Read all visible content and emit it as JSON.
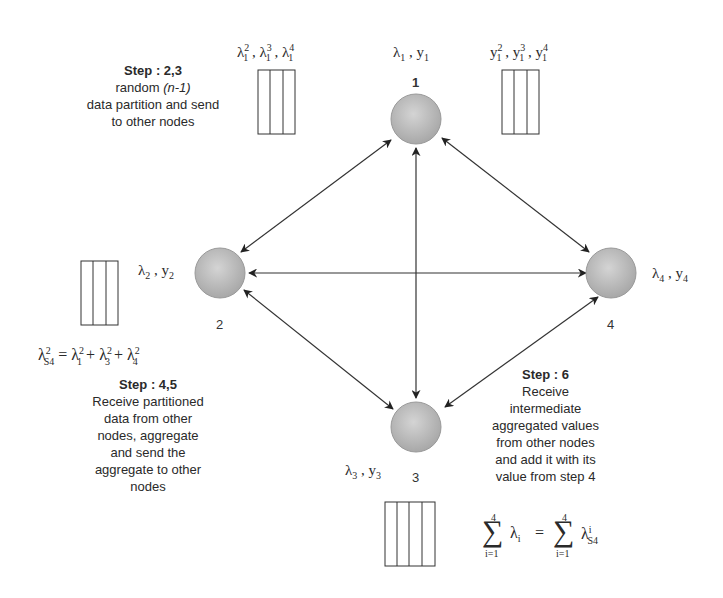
{
  "diagram": {
    "type": "distributed-aggregation-network",
    "nodes": [
      {
        "id": "1",
        "label": "1",
        "vars": "λ1 , y1",
        "x": 416,
        "y": 119
      },
      {
        "id": "2",
        "label": "2",
        "vars": "λ2 , y2",
        "x": 220,
        "y": 273
      },
      {
        "id": "3",
        "label": "3",
        "vars": "λ3 , y3",
        "x": 416,
        "y": 427
      },
      {
        "id": "4",
        "label": "4",
        "vars": "λ4 , y4",
        "x": 611,
        "y": 273
      }
    ],
    "edges": [
      {
        "from": "1",
        "to": "2",
        "bidirectional": true
      },
      {
        "from": "1",
        "to": "3",
        "bidirectional": true
      },
      {
        "from": "1",
        "to": "4",
        "bidirectional": true
      },
      {
        "from": "2",
        "to": "3",
        "bidirectional": true
      },
      {
        "from": "2",
        "to": "4",
        "bidirectional": true
      },
      {
        "from": "3",
        "to": "4",
        "bidirectional": true
      }
    ]
  },
  "node_labels": {
    "n1": "1",
    "n2": "2",
    "n3": "3",
    "n4": "4"
  },
  "partitions": {
    "lambda1_parts": {
      "base": "λ",
      "items": [
        {
          "sup": "2",
          "sub": "1"
        },
        {
          "sup": "3",
          "sub": "1"
        },
        {
          "sup": "4",
          "sub": "1"
        }
      ]
    },
    "y1_parts": {
      "base": "y",
      "items": [
        {
          "sup": "2",
          "sub": "1"
        },
        {
          "sup": "3",
          "sub": "1"
        },
        {
          "sup": "4",
          "sub": "1"
        }
      ]
    }
  },
  "steps": {
    "step23": {
      "title": "Step : 2,3",
      "line1_prefix": "random ",
      "line1_italic": "(n-1)",
      "line2": "data partition and send",
      "line3": "to other nodes"
    },
    "step45": {
      "title": "Step : 4,5",
      "lines": [
        "Receive partitioned",
        "data from other",
        "nodes, aggregate",
        "and send the",
        "aggregate to other",
        "nodes"
      ]
    },
    "step6": {
      "title": "Step : 6",
      "lines": [
        "Receive",
        "intermediate",
        "aggregated values",
        "from other nodes",
        "and add it with its",
        "value from step 4"
      ]
    }
  },
  "equations": {
    "partial_sum": "λ²S4 = λ²1 + λ²3 + λ²4",
    "total_sum": "Σ(i=1..4) λi = Σ(i=1..4) λⁱS4",
    "sum_upper": "4",
    "sum_lower": "i=1"
  }
}
